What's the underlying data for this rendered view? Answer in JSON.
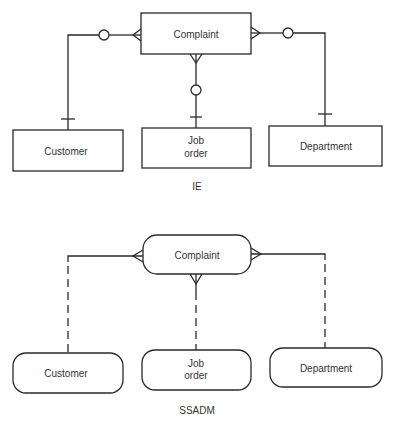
{
  "diagrams": [
    {
      "notation": "IE",
      "caption": "IE",
      "entities": {
        "complaint": "Complaint",
        "customer": "Customer",
        "job_order_line1": "Job",
        "job_order_line2": "order",
        "department": "Department"
      },
      "relationships": [
        {
          "from": "Customer",
          "to": "Complaint",
          "one_end": "Customer",
          "many_end": "Complaint",
          "optional_at": "Complaint"
        },
        {
          "from": "Job order",
          "to": "Complaint",
          "one_end": "Job order",
          "many_end": "Complaint",
          "optional_at": "Complaint"
        },
        {
          "from": "Department",
          "to": "Complaint",
          "one_end": "Department",
          "many_end": "Complaint",
          "optional_at": "Complaint"
        }
      ]
    },
    {
      "notation": "SSADM",
      "caption": "SSADM",
      "entities": {
        "complaint": "Complaint",
        "customer": "Customer",
        "job_order_line1": "Job",
        "job_order_line2": "order",
        "department": "Department"
      },
      "relationships": [
        {
          "from": "Customer",
          "to": "Complaint",
          "many_end": "Complaint",
          "optional_at": "Customer"
        },
        {
          "from": "Job order",
          "to": "Complaint",
          "many_end": "Complaint",
          "optional_at": "Job order"
        },
        {
          "from": "Department",
          "to": "Complaint",
          "many_end": "Complaint",
          "optional_at": "Department"
        }
      ]
    }
  ]
}
